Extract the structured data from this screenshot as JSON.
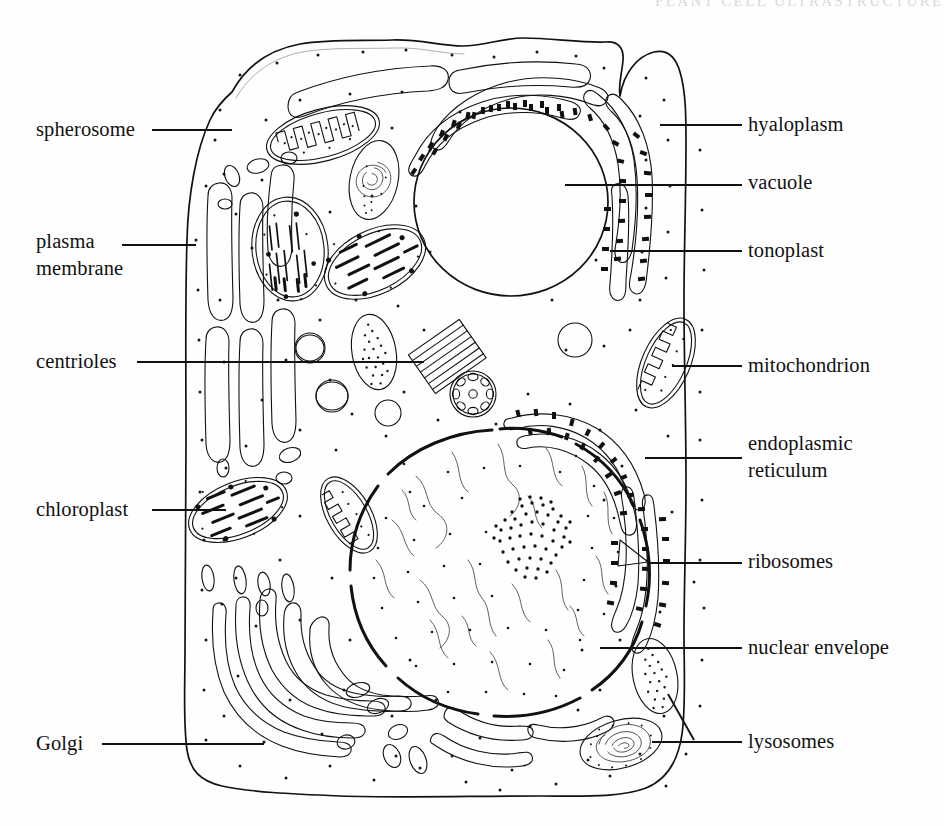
{
  "figure": {
    "kind": "labeled-biological-diagram",
    "subject": "plant cell ultrastructure",
    "cut_caption_fragment": "PLANT CELL ULTRASTRUCTURE",
    "background_color": "#ffffff",
    "ink_color": "#111111"
  },
  "labels_left": [
    {
      "id": "spherosome",
      "text": "spherosome",
      "line2": "",
      "x": 36,
      "y": 116,
      "leader_from_x": 152,
      "leader_from_y": 130,
      "leader_to_x": 232,
      "leader_to_y": 130
    },
    {
      "id": "plasma-membrane",
      "text": "plasma",
      "line2": "membrane",
      "x": 36,
      "y": 228,
      "leader_from_x": 122,
      "leader_from_y": 245,
      "leader_to_x": 196,
      "leader_to_y": 245
    },
    {
      "id": "centrioles",
      "text": "centrioles",
      "line2": "",
      "x": 36,
      "y": 348,
      "leader_from_x": 137,
      "leader_from_y": 362,
      "leader_to_x": 424,
      "leader_to_y": 362
    },
    {
      "id": "chloroplast",
      "text": "chloroplast",
      "line2": "",
      "x": 36,
      "y": 496,
      "leader_from_x": 152,
      "leader_from_y": 510,
      "leader_to_x": 226,
      "leader_to_y": 510
    },
    {
      "id": "golgi",
      "text": "Golgi",
      "line2": "",
      "x": 36,
      "y": 730,
      "leader_from_x": 102,
      "leader_from_y": 744,
      "leader_to_x": 264,
      "leader_to_y": 744
    }
  ],
  "labels_right": [
    {
      "id": "hyaloplasm",
      "text": "hyaloplasm",
      "line2": "",
      "x": 748,
      "y": 111,
      "leader_from_x": 660,
      "leader_from_y": 125,
      "leader_to_x": 742,
      "leader_to_y": 125
    },
    {
      "id": "vacuole",
      "text": "vacuole",
      "line2": "",
      "x": 748,
      "y": 169,
      "leader_from_x": 565,
      "leader_from_y": 185,
      "leader_to_x": 742,
      "leader_to_y": 185
    },
    {
      "id": "tonoplast",
      "text": "tonoplast",
      "line2": "",
      "x": 748,
      "y": 237,
      "leader_from_x": 610,
      "leader_from_y": 251,
      "leader_to_x": 742,
      "leader_to_y": 251
    },
    {
      "id": "mitochondrion",
      "text": "mitochondrion",
      "line2": "",
      "x": 748,
      "y": 352,
      "leader_from_x": 672,
      "leader_from_y": 366,
      "leader_to_x": 742,
      "leader_to_y": 366
    },
    {
      "id": "endoplasmic-reticulum",
      "text": "endoplasmic",
      "line2": "reticulum",
      "x": 748,
      "y": 430,
      "leader_from_x": 645,
      "leader_from_y": 458,
      "leader_to_x": 742,
      "leader_to_y": 458
    },
    {
      "id": "ribosomes",
      "text": "ribosomes",
      "line2": "",
      "x": 748,
      "y": 548,
      "leader_from_x": 672,
      "leader_from_y": 563,
      "leader_to_x": 742,
      "leader_to_y": 563
    },
    {
      "id": "nuclear-envelope",
      "text": "nuclear envelope",
      "line2": "",
      "x": 748,
      "y": 634,
      "leader_from_x": 600,
      "leader_from_y": 648,
      "leader_to_x": 742,
      "leader_to_y": 648
    },
    {
      "id": "lysosomes",
      "text": "lysosomes",
      "line2": "",
      "x": 748,
      "y": 728,
      "leader_from_x": 652,
      "leader_from_y": 742,
      "leader_to_x": 742,
      "leader_to_y": 742
    }
  ],
  "organelles": [
    {
      "id": "vacuole",
      "name": "vacuole",
      "shape": "large round clear body",
      "cx": 510,
      "cy": 200,
      "r": 96
    },
    {
      "id": "nucleus",
      "name": "nucleus",
      "shape": "large round body with chromatin and nucleolus",
      "cx": 500,
      "cy": 570,
      "r": 140
    },
    {
      "id": "nucleolus",
      "name": "nucleolus",
      "shape": "dense stippled patch",
      "cx": 535,
      "cy": 532,
      "r": 34
    },
    {
      "id": "spherosome",
      "name": "spherosome",
      "shape": "small empty circle",
      "cx": 250,
      "cy": 129,
      "r": 24
    },
    {
      "id": "mitochondrion-1",
      "name": "mitochondrion",
      "shape": "oval with zigzag cristae",
      "cx": 323,
      "cy": 135
    },
    {
      "id": "mitochondrion-2",
      "name": "mitochondrion",
      "shape": "oval with zigzag cristae",
      "cx": 349,
      "cy": 515
    },
    {
      "id": "mitochondrion-3",
      "name": "mitochondrion",
      "shape": "oval with zigzag cristae",
      "cx": 666,
      "cy": 363
    },
    {
      "id": "chloroplast-1",
      "name": "chloroplast",
      "shape": "oval with grana stacks",
      "cx": 290,
      "cy": 249
    },
    {
      "id": "chloroplast-2",
      "name": "chloroplast",
      "shape": "oval with grana stacks",
      "cx": 370,
      "cy": 262
    },
    {
      "id": "chloroplast-3",
      "name": "chloroplast",
      "shape": "oval with grana stacks",
      "cx": 238,
      "cy": 510
    },
    {
      "id": "lysosome-1",
      "name": "lysosome",
      "shape": "oval stippled body",
      "cx": 374,
      "cy": 352
    },
    {
      "id": "lysosome-2",
      "name": "lysosome",
      "shape": "oval stippled body",
      "cx": 655,
      "cy": 676
    },
    {
      "id": "lysosome-3",
      "name": "lysosome (whorled)",
      "shape": "oval with concentric whorl",
      "cx": 621,
      "cy": 744
    },
    {
      "id": "golgi-body",
      "name": "Golgi body",
      "shape": "stack of curved cisternae with vesicles",
      "cx": 300,
      "cy": 680
    },
    {
      "id": "rough-er",
      "name": "rough endoplasmic reticulum",
      "shape": "ribosome-studded cisternae",
      "cx": 590,
      "cy": 300
    },
    {
      "id": "smooth-er",
      "name": "smooth endoplasmic reticulum",
      "shape": "smooth tubular cisternae",
      "cx": 225,
      "cy": 330
    },
    {
      "id": "centriole-long",
      "name": "centriole longitudinal section",
      "shape": "striped cylinder",
      "cx": 445,
      "cy": 358
    },
    {
      "id": "centriole-cross",
      "name": "centriole cross section",
      "shape": "circle of nine triplets",
      "cx": 472,
      "cy": 394,
      "r": 22
    },
    {
      "id": "plasma-membrane",
      "name": "plasma membrane",
      "shape": "outer cell boundary"
    },
    {
      "id": "tonoplast",
      "name": "tonoplast",
      "shape": "vacuole boundary membrane"
    },
    {
      "id": "hyaloplasm",
      "name": "hyaloplasm",
      "shape": "stippled ground cytoplasm"
    }
  ]
}
